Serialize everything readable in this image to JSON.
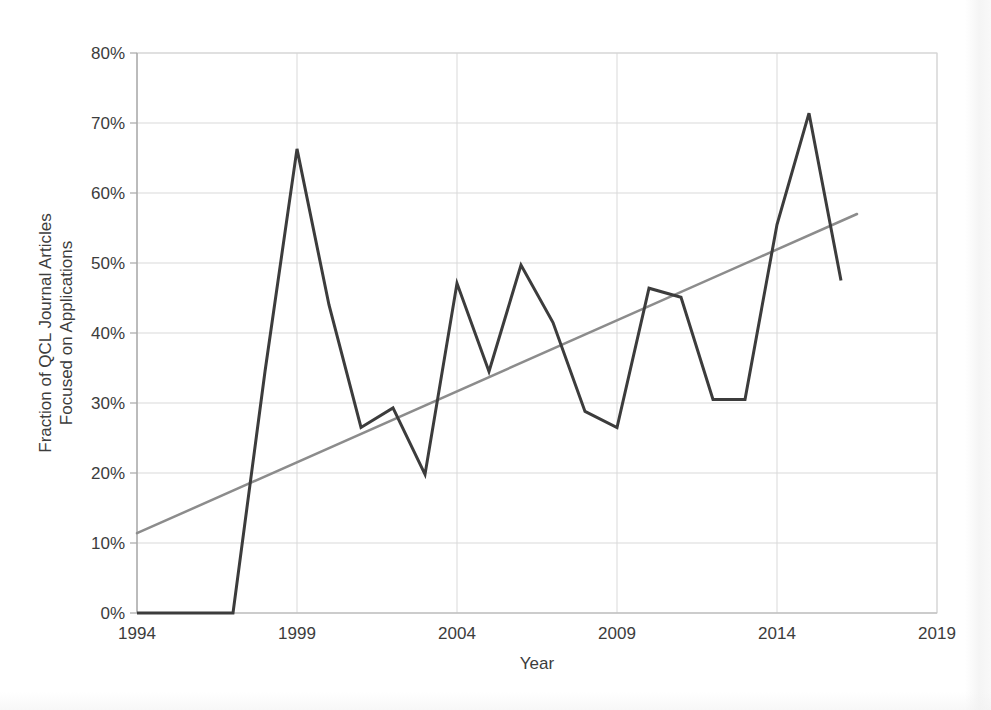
{
  "chart_data": {
    "type": "line",
    "title": "",
    "xlabel": "Year",
    "ylabel": "Fraction of QCL Journal Articles Focused on Applications",
    "ylabel_line1": "Fraction of QCL Journal Articles",
    "ylabel_line2": "Focused on Applications",
    "xlim": [
      1994,
      2019
    ],
    "ylim": [
      0,
      80
    ],
    "xticks": [
      1994,
      1999,
      2004,
      2009,
      2014,
      2019
    ],
    "xtick_labels": [
      "1994",
      "1999",
      "2004",
      "2009",
      "2014",
      "2019"
    ],
    "yticks": [
      0,
      10,
      20,
      30,
      40,
      50,
      60,
      70,
      80
    ],
    "ytick_labels": [
      "0%",
      "10%",
      "20%",
      "30%",
      "40%",
      "50%",
      "60%",
      "70%",
      "80%"
    ],
    "grid": true,
    "grid_axis": "both",
    "legend": "none",
    "x": [
      1994,
      1995,
      1996,
      1997,
      1998,
      1999,
      2000,
      2001,
      2002,
      2003,
      2004,
      2005,
      2006,
      2007,
      2008,
      2009,
      2010,
      2011,
      2012,
      2013,
      2014,
      2015,
      2016
    ],
    "series": [
      {
        "name": "Fraction of QCL journal articles focused on applications",
        "color": "#3c3c3c",
        "width": 3,
        "values": [
          0,
          0,
          0,
          0,
          34.5,
          66.3,
          44.0,
          26.5,
          29.3,
          19.8,
          47.1,
          34.5,
          49.7,
          41.5,
          28.8,
          26.5,
          46.4,
          45.1,
          30.5,
          30.5,
          55.5,
          71.4,
          47.5
        ]
      },
      {
        "name": "Linear trend",
        "color": "#8c8c8c",
        "width": 2.5,
        "type": "trendline",
        "x_start": 1994,
        "y_start": 11.4,
        "x_end": 2016.5,
        "y_end": 57.0
      }
    ]
  },
  "axis": {
    "x_title": "Year",
    "y_title_line1": "Fraction of QCL Journal Articles",
    "y_title_line2": "Focused on Applications"
  },
  "colors": {
    "data_line": "#3c3c3c",
    "trend_line": "#8c8c8c",
    "grid": "#d9d9d9",
    "axis": "#bfbfbf",
    "text": "#3c3c3c",
    "background": "#ffffff"
  }
}
